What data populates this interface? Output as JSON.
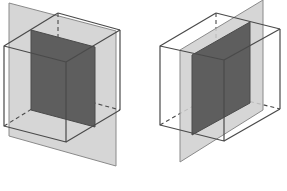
{
  "diagram": {
    "colors": {
      "background": "#ffffff",
      "plane_fill": "#cfcfcf",
      "plane_stroke": "#8a8a8a",
      "section_fill": "#5e5e5e",
      "edge_stroke": "#4a4a4a"
    },
    "figures": [
      {
        "id": "left",
        "description": "Cube cut by a vertical plane parallel to its front face; shaded cross-section rectangle",
        "plane": "9,3 116,31 116,166 9,136",
        "cube": {
          "front": "4,46 66,62 66,142 4,126",
          "back_visible_top": "58,13 120,30",
          "back_visible_right": "120,30 120,110",
          "top_left_edge": "4,46 58,13",
          "top_right_edge": "66,62 120,30",
          "bottom_right_edge": "66,142 120,110",
          "hidden_vertical": "58,13 58,93",
          "hidden_back_bottom": "58,93 120,110",
          "hidden_left_bottom": "4,126 58,93"
        },
        "section": "31,30 95,47 95,127 31,110",
        "section_hidden_edges": [
          "31,110 95,127"
        ]
      },
      {
        "id": "right",
        "description": "Cube cut by a vertical diagonal plane; shaded cross-section rectangle",
        "plane": "180,50 263,0 263,110 180,162",
        "cube": {
          "front": "160,46 224,60 224,141 160,125",
          "back_visible_top": "216,13 280,29",
          "back_visible_right": "280,29 280,109",
          "top_left_edge": "160,46 216,13",
          "top_right_edge": "224,60 280,29",
          "bottom_right_edge": "224,141 280,109",
          "hidden_vertical": "216,13 216,93",
          "hidden_back_bottom": "216,93 280,109",
          "hidden_left_bottom": "160,125 216,93"
        },
        "section": "192,55 250,22 250,103 192,135",
        "section_hidden_edges": []
      }
    ]
  }
}
